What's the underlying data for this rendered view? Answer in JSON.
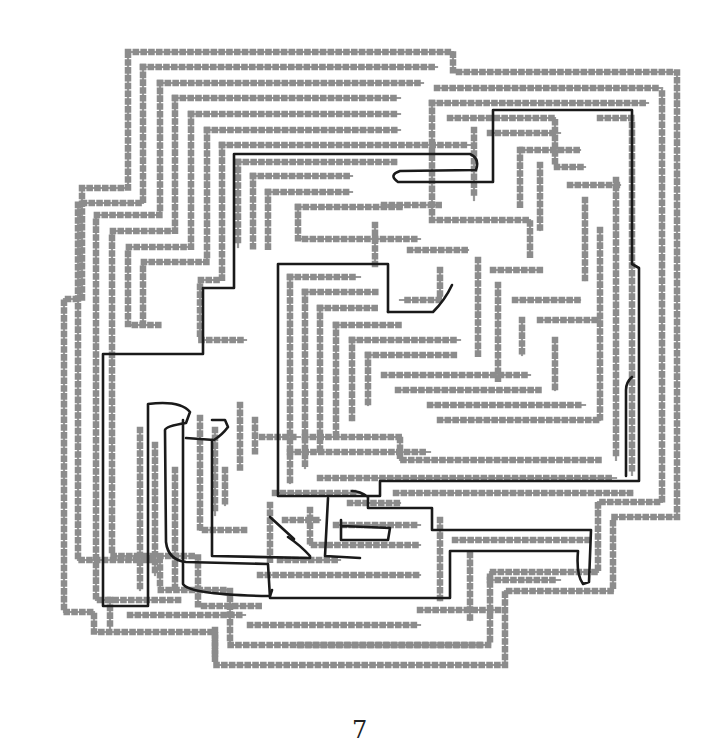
{
  "page": {
    "number": "7"
  },
  "maze": {
    "wall_color": "#8c8c8c",
    "path_color": "#1a1a1a",
    "walls": [
      "M128,52 L453,52 L453,72 L677,72 L677,342 L677,517 L613,517 L613,591 L505,591 L505,665 L215,665 L215,632 L94,632 L94,612 L64,612 L64,490 L64,299 L82,299 L82,188 L128,188 Z",
      "M143,67 L437,67",
      "M143,67 L143,203 L78,203 L78,300 L78,560 L160,560 L160,590 L230,590 L230,645 L490,645 L490,572 L598,572 L598,502 L662,502 L662,88",
      "M437,88 L437,88 L662,88",
      "M160,83 L423,83",
      "M160,83 L160,215 L96,215 L96,600 L180,600",
      "M175,98 L400,98",
      "M175,98 L175,231 L112,231 L112,556 L198,556 L198,606 L260,606",
      "M191,114 L400,114",
      "M191,114 L191,247 L128,247 L128,325 L160,325",
      "M207,130 L400,130",
      "M207,130 L207,262 L143,262 L143,325",
      "M222,145 L470,145",
      "M222,145 L222,280 L200,280 L200,340 L246,340",
      "M238,162 L396,162",
      "M238,162 L238,247",
      "M253,176 L352,176",
      "M253,176 L253,247",
      "M268,192 L352,192",
      "M268,192 L268,247",
      "M298,207 L400,207",
      "M298,207 L298,239 L420,239",
      "M432,103 L648,103",
      "M432,103 L432,220 L530,220 L530,256",
      "M450,118 L555,118 L555,167 L585,167",
      "M600,118 L632,118 L632,475",
      "M474,130 L474,200",
      "M490,133 L560,133",
      "M522,150 L580,150",
      "M520,150 L520,205",
      "M540,165 L540,230",
      "M570,185 L620,185",
      "M384,205 L440,205",
      "M375,225 L375,265",
      "M410,250 L468,250",
      "M440,270 L440,300 L400,300",
      "M478,260 L478,355",
      "M493,270 L540,270",
      "M498,285 L498,380",
      "M515,300 L580,300",
      "M522,320 L522,355",
      "M540,320 L600,320",
      "M555,340 L555,390",
      "M585,200 L585,280",
      "M600,230 L600,420",
      "M616,180 L616,460",
      "M290,277 L360,277",
      "M290,277 L290,483",
      "M305,292 L376,292",
      "M305,292 L305,468",
      "M320,308 L376,308",
      "M320,308 L320,452",
      "M336,325 L400,325",
      "M336,325 L336,437",
      "M352,340 L460,340",
      "M352,340 L352,420",
      "M368,355 L455,355",
      "M368,355 L368,405",
      "M384,375 L530,375",
      "M398,390 L540,390",
      "M430,405 L585,405",
      "M440,420 L600,420",
      "M290,452 L430,452",
      "M305,437 L400,437",
      "M400,440 L400,460 L600,460",
      "M320,478 L616,478",
      "M275,493 L360,493",
      "M396,493 L632,493",
      "M240,405 L240,468",
      "M255,420 L255,452",
      "M200,418 L200,530 L245,530",
      "M215,430 L215,515",
      "M262,437 L300,437",
      "M225,470 L225,505",
      "M270,505 L270,560",
      "M285,520 L320,520",
      "M310,510 L310,545 L420,545",
      "M336,525 L420,525",
      "M350,503 L400,503",
      "M440,520 L440,600",
      "M455,540 L590,540",
      "M470,555 L470,620",
      "M490,580 L560,580",
      "M140,430 L140,590",
      "M155,445 L155,575",
      "M175,470 L175,590",
      "M260,575 L420,575",
      "M280,560 L340,560",
      "M110,600 L110,628",
      "M130,615 L245,615",
      "M215,630 L215,660",
      "M250,625 L420,625",
      "M420,610 L500,610",
      "M300,645 L480,645"
    ],
    "solution_paths": [
      "M388,312 L388,264 L278,264 L278,496 L380,496 L380,481 L639,481 L639,268 L632,264 L632,110 L493,110 L493,182 L398,182 Q388,175 400,171 L476,170 Q480,158 470,154 L234,154 L234,288 L203,288 L203,354 L103,354 L103,606 L148,606 L148,404 Q180,400 190,412 L186,423 Q166,426 165,430 L166,542 Q168,560 186,562 L268,564 L270,598 L450,598 L450,551 L578,551 Q576,575 583,584 L589,582 L591,530 L432,530 L432,508 L368,508 L368,497 Q360,491 352,491",
      "M270,517 Q282,528 294,539",
      "M388,312 L433,312 Q445,300 452,285",
      "M183,420 L183,584 Q190,595 270,596 L272,590",
      "M186,438 L214,440 Q222,435 228,427 L225,420 L212,420",
      "M212,440 L212,556 L310,558 L310,556 Q300,545 288,537",
      "M328,498 L325,556 L360,558",
      "M632,377 Q626,382 626,390 L626,476",
      "M341,520 L341,540 L388,540 L390,528 L342,526"
    ]
  }
}
